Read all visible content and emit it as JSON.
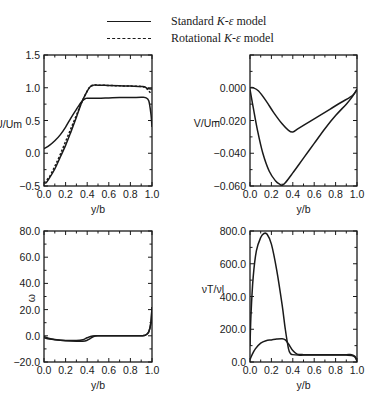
{
  "legend": {
    "items": [
      {
        "style": "solid",
        "prefix": "Standard ",
        "model_symbol": "K-ε",
        "suffix": " model"
      },
      {
        "style": "dashed",
        "prefix": "Rotational ",
        "model_symbol": "K-ε",
        "suffix": " model"
      }
    ]
  },
  "colors": {
    "line": "#1a1a1a",
    "background": "#ffffff"
  },
  "chart_data": [
    {
      "id": "u-profile",
      "type": "line",
      "title": "",
      "xlabel": "y/b",
      "ylabel": "U/Um",
      "xlim": [
        0.0,
        1.0
      ],
      "ylim": [
        -0.5,
        1.5
      ],
      "xticks": [
        "0.0",
        "0.2",
        "0.4",
        "0.6",
        "0.8",
        "1.0"
      ],
      "yticks": [
        "-0.5",
        "0.0",
        "0.5",
        "1.0",
        "1.5"
      ],
      "ytick_values": [
        -0.5,
        0.0,
        0.5,
        1.0,
        1.5
      ],
      "grid": false,
      "frame": {
        "x": 44,
        "y": 55,
        "w": 108,
        "h": 131
      },
      "series": [
        {
          "name": "Standard K-ε model (curve A)",
          "style": "solid",
          "x": [
            0.0,
            0.05,
            0.1,
            0.15,
            0.2,
            0.25,
            0.3,
            0.35,
            0.38,
            0.4,
            0.5,
            0.6,
            0.7,
            0.8,
            0.9,
            0.94,
            0.97,
            0.99,
            1.0
          ],
          "y": [
            0.07,
            0.12,
            0.19,
            0.28,
            0.4,
            0.54,
            0.67,
            0.79,
            0.83,
            0.84,
            0.84,
            0.845,
            0.85,
            0.85,
            0.855,
            0.85,
            0.8,
            0.6,
            0.4
          ]
        },
        {
          "name": "Standard K-ε model (curve B)",
          "style": "solid",
          "x": [
            0.0,
            0.02,
            0.05,
            0.1,
            0.15,
            0.2,
            0.25,
            0.3,
            0.35,
            0.4,
            0.43,
            0.46,
            0.5,
            0.6,
            0.7,
            0.8,
            0.9,
            0.93,
            0.96,
            1.0
          ],
          "y": [
            -0.45,
            -0.45,
            -0.38,
            -0.24,
            -0.06,
            0.12,
            0.33,
            0.55,
            0.78,
            0.95,
            1.02,
            1.04,
            1.04,
            1.035,
            1.03,
            1.025,
            1.02,
            1.015,
            0.99,
            0.98
          ]
        },
        {
          "name": "Rotational K-ε model",
          "style": "dashed",
          "x": [
            0.0,
            0.05,
            0.1,
            0.15,
            0.2,
            0.25,
            0.3,
            0.35,
            0.4,
            0.43,
            0.46,
            0.5,
            0.6,
            0.7,
            0.8,
            0.9,
            0.94,
            0.97,
            1.0
          ],
          "y": [
            -0.45,
            -0.36,
            -0.2,
            -0.02,
            0.18,
            0.38,
            0.58,
            0.78,
            0.95,
            1.02,
            1.04,
            1.04,
            1.035,
            1.03,
            1.025,
            1.02,
            1.0,
            0.95,
            0.9
          ]
        }
      ]
    },
    {
      "id": "v-profile",
      "type": "line",
      "title": "",
      "xlabel": "y/b",
      "ylabel": "V/Um",
      "xlim": [
        0.0,
        1.0
      ],
      "ylim": [
        -0.06,
        0.02
      ],
      "xticks": [
        "0.0",
        "0.2",
        "0.4",
        "0.6",
        "0.8",
        "1.0"
      ],
      "yticks": [
        "0.000",
        "-0.020",
        "-0.040",
        "-0.060"
      ],
      "ytick_values": [
        0.0,
        -0.02,
        -0.04,
        -0.06
      ],
      "grid": false,
      "frame": {
        "x": 250,
        "y": 55,
        "w": 107,
        "h": 131
      },
      "series": [
        {
          "name": "Curve A (shallow minimum)",
          "style": "solid",
          "x": [
            0.0,
            0.03,
            0.08,
            0.15,
            0.22,
            0.3,
            0.36,
            0.4,
            0.45,
            0.55,
            0.65,
            0.75,
            0.85,
            0.93,
            0.97,
            1.0
          ],
          "y": [
            0.0,
            0.0,
            -0.002,
            -0.008,
            -0.015,
            -0.022,
            -0.026,
            -0.027,
            -0.025,
            -0.021,
            -0.017,
            -0.013,
            -0.009,
            -0.006,
            -0.004,
            -0.001
          ]
        },
        {
          "name": "Curve B (deep minimum)",
          "style": "solid",
          "x": [
            0.0,
            0.03,
            0.07,
            0.12,
            0.18,
            0.24,
            0.28,
            0.3,
            0.33,
            0.4,
            0.5,
            0.6,
            0.7,
            0.8,
            0.9,
            0.95,
            1.0
          ],
          "y": [
            -0.001,
            -0.012,
            -0.026,
            -0.04,
            -0.051,
            -0.057,
            -0.059,
            -0.0595,
            -0.058,
            -0.052,
            -0.043,
            -0.034,
            -0.025,
            -0.017,
            -0.01,
            -0.006,
            -0.001
          ]
        }
      ]
    },
    {
      "id": "omega-profile",
      "type": "line",
      "title": "",
      "xlabel": "y/b",
      "ylabel": "ω",
      "xlim": [
        0.0,
        1.0
      ],
      "ylim": [
        -20.0,
        80.0
      ],
      "xticks": [
        "0.0",
        "0.2",
        "0.4",
        "0.6",
        "0.8",
        "1.0"
      ],
      "yticks": [
        "-20.0",
        "0.0",
        "20.0",
        "40.0",
        "60.0",
        "80.0"
      ],
      "ytick_values": [
        -20,
        0,
        20,
        40,
        60,
        80
      ],
      "grid": false,
      "frame": {
        "x": 44,
        "y": 231,
        "w": 108,
        "h": 131
      },
      "series": [
        {
          "name": "Curve A",
          "style": "solid",
          "x": [
            0.0,
            0.05,
            0.1,
            0.2,
            0.3,
            0.36,
            0.4,
            0.45,
            0.5,
            0.6,
            0.7,
            0.8,
            0.9,
            0.94,
            0.97,
            0.99,
            1.0
          ],
          "y": [
            -1.5,
            -2.5,
            -3.0,
            -3.5,
            -3.6,
            -3.0,
            -1.5,
            -0.2,
            0.0,
            0.0,
            0.0,
            0.0,
            0.0,
            0.5,
            3.0,
            10.0,
            22.0
          ]
        },
        {
          "name": "Curve B",
          "style": "solid",
          "x": [
            0.0,
            0.05,
            0.1,
            0.2,
            0.3,
            0.38,
            0.42,
            0.46,
            0.5,
            0.6,
            0.7,
            0.8,
            0.9,
            0.94,
            0.97,
            0.99,
            1.0
          ],
          "y": [
            -0.5,
            -2.0,
            -2.8,
            -3.8,
            -4.2,
            -4.0,
            -2.5,
            -0.5,
            0.0,
            0.0,
            0.0,
            0.0,
            0.0,
            0.5,
            3.0,
            10.0,
            22.0
          ]
        }
      ]
    },
    {
      "id": "viscosity-ratio-profile",
      "type": "line",
      "title": "",
      "xlabel": "y/b",
      "ylabel": "νT/νl",
      "xlim": [
        0.0,
        1.0
      ],
      "ylim": [
        0.0,
        800.0
      ],
      "xticks": [
        "0.0",
        "0.2",
        "0.4",
        "0.6",
        "0.8",
        "1.0"
      ],
      "yticks": [
        "0.0",
        "200.0",
        "400.0",
        "600.0",
        "800.0"
      ],
      "ytick_values": [
        0,
        200,
        400,
        600,
        800
      ],
      "grid": false,
      "frame": {
        "x": 250,
        "y": 231,
        "w": 107,
        "h": 131
      },
      "series": [
        {
          "name": "Curve A (large peak)",
          "style": "solid",
          "x": [
            0.0,
            0.01,
            0.03,
            0.06,
            0.1,
            0.13,
            0.16,
            0.2,
            0.25,
            0.3,
            0.33,
            0.36,
            0.38,
            0.4,
            0.45,
            0.5,
            0.6,
            0.7,
            0.8,
            0.9,
            0.95,
            0.98,
            1.0
          ],
          "y": [
            100,
            300,
            520,
            680,
            760,
            785,
            780,
            720,
            560,
            350,
            200,
            80,
            50,
            45,
            42,
            42,
            42,
            42,
            42,
            42,
            40,
            30,
            5
          ]
        },
        {
          "name": "Curve B (small peak)",
          "style": "solid",
          "x": [
            0.0,
            0.02,
            0.05,
            0.1,
            0.15,
            0.2,
            0.25,
            0.3,
            0.33,
            0.36,
            0.4,
            0.44,
            0.5,
            0.6,
            0.7,
            0.8,
            0.9,
            0.95,
            0.98,
            1.0
          ],
          "y": [
            15,
            45,
            80,
            115,
            130,
            135,
            140,
            142,
            135,
            110,
            70,
            48,
            45,
            45,
            45,
            45,
            45,
            45,
            35,
            10
          ]
        }
      ]
    }
  ]
}
